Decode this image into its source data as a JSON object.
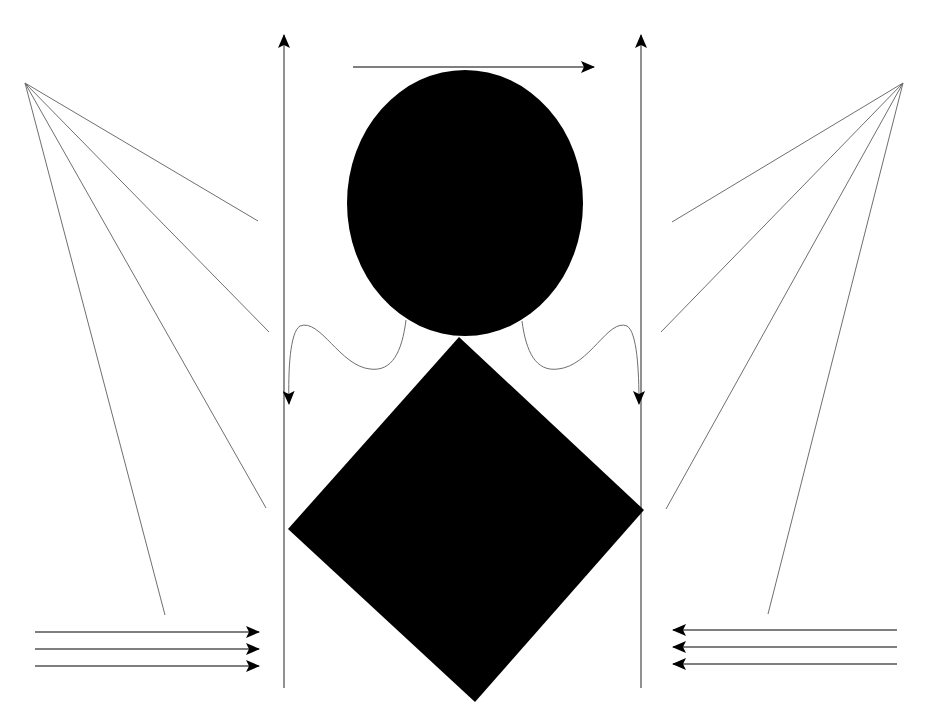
{
  "diagram": {
    "colors": {
      "background": "#ffffff",
      "fill": "#000000",
      "line": "#6f6f6f"
    },
    "ellipse": {
      "cx": 465,
      "cy": 203,
      "rx": 118,
      "ry": 133
    },
    "diamond": {
      "points": [
        [
          459,
          337
        ],
        [
          644,
          510
        ],
        [
          475,
          702
        ],
        [
          288,
          529
        ]
      ]
    },
    "top_arrow": {
      "x1": 353,
      "y1": 67,
      "x2": 594,
      "y2": 67
    },
    "vertical_axes": [
      {
        "id": "left",
        "x": 284,
        "y_top": 35,
        "y_bottom": 688
      },
      {
        "id": "right",
        "x": 641,
        "y_top": 35,
        "y_bottom": 688
      }
    ],
    "left_fan": {
      "apex": [
        25,
        83
      ],
      "ends": [
        [
          258,
          221
        ],
        [
          269,
          332
        ],
        [
          266,
          508
        ],
        [
          165,
          615
        ]
      ]
    },
    "right_fan": {
      "apex": [
        903,
        83
      ],
      "ends": [
        [
          672,
          222
        ],
        [
          661,
          332
        ],
        [
          666,
          509
        ],
        [
          768,
          614
        ]
      ]
    },
    "wavy_arrows": [
      {
        "id": "left",
        "path": "M406,320 C402,352 392,372 370,369 C340,366 320,318 300,326 C290,332 288,370 289,404"
      },
      {
        "id": "right",
        "path": "M522,321 C526,352 536,372 558,369 C590,366 608,318 627,326 C637,332 639,370 639,404"
      }
    ],
    "left_arrows": {
      "x_start": 35,
      "x_end": 259,
      "ys": [
        632,
        649,
        666
      ],
      "direction": "right"
    },
    "right_arrows": {
      "x_start": 897,
      "x_end": 673,
      "ys": [
        630,
        647,
        664
      ],
      "direction": "left"
    }
  }
}
